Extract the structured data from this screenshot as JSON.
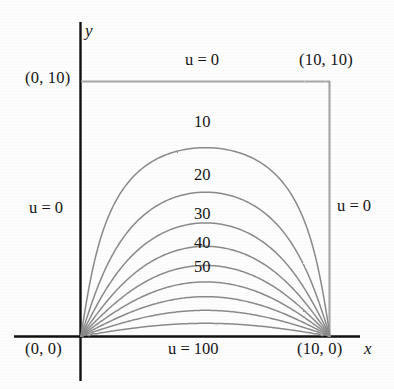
{
  "figure": {
    "axes": {
      "x_label": "x",
      "y_label": "y"
    },
    "corner_labels": [
      {
        "name": "origin",
        "text": "(0, 0)"
      },
      {
        "name": "top-left",
        "text": "(0, 10)"
      },
      {
        "name": "top-right",
        "text": "(10, 10)"
      },
      {
        "name": "bottom-right",
        "text": "(10, 0)"
      }
    ],
    "boundary_conditions": [
      {
        "name": "top",
        "text": "u = 0"
      },
      {
        "name": "left",
        "text": "u = 0"
      },
      {
        "name": "right",
        "text": "u = 0"
      },
      {
        "name": "bottom",
        "text": "u = 100"
      }
    ],
    "contour_labels": [
      "10",
      "20",
      "30",
      "40",
      "50"
    ]
  },
  "chart_data": {
    "type": "line",
    "xlabel": "x",
    "ylabel": "y",
    "xlim": [
      0,
      10
    ],
    "ylim": [
      0,
      10
    ],
    "grid": false,
    "legend": "none",
    "domain": {
      "x_min": 0,
      "x_max": 10,
      "y_min": 0,
      "y_max": 10
    },
    "boundary_values": {
      "top": 0,
      "left": 0,
      "right": 0,
      "bottom": 100
    },
    "labeled_levels": [
      10,
      20,
      30,
      40,
      50
    ],
    "unlabeled_levels": [
      60,
      70,
      80,
      90
    ],
    "series": [
      {
        "name": "u = 10",
        "level": 10,
        "label": "10",
        "apex_y": 7.05,
        "labeled": true
      },
      {
        "name": "u = 20",
        "level": 20,
        "label": "20",
        "apex_y": 5.05,
        "labeled": true
      },
      {
        "name": "u = 30",
        "level": 30,
        "label": "30",
        "apex_y": 3.85,
        "labeled": true
      },
      {
        "name": "u = 40",
        "level": 40,
        "label": "40",
        "apex_y": 2.85,
        "labeled": true
      },
      {
        "name": "u = 50",
        "level": 50,
        "label": "50",
        "apex_y": 2.05,
        "labeled": true
      },
      {
        "name": "u = 60",
        "level": 60,
        "label": "",
        "apex_y": 1.55,
        "labeled": false
      },
      {
        "name": "u = 70",
        "level": 70,
        "label": "",
        "apex_y": 1.15,
        "labeled": false
      },
      {
        "name": "u = 80",
        "level": 80,
        "label": "",
        "apex_y": 0.78,
        "labeled": false
      },
      {
        "name": "u = 90",
        "level": 90,
        "label": "",
        "apex_y": 0.42,
        "labeled": false
      }
    ],
    "annotations": [
      {
        "text": "u = 0",
        "x": 5,
        "y": 10.6
      },
      {
        "text": "u = 0",
        "x": -1.4,
        "y": 5.0
      },
      {
        "text": "u = 0",
        "x": 11.5,
        "y": 5.1
      },
      {
        "text": "u = 100",
        "x": 5,
        "y": -0.6
      },
      {
        "text": "(0, 0)",
        "x": -1.1,
        "y": -0.6
      },
      {
        "text": "(0, 10)",
        "x": -1.3,
        "y": 10.0
      },
      {
        "text": "(10, 10)",
        "x": 11.3,
        "y": 10.6
      },
      {
        "text": "(10, 0)",
        "x": 11.0,
        "y": -0.6
      }
    ]
  },
  "colors": {
    "axis": "#111111",
    "contour": "#8a8a8a",
    "boundary": "#a0a0a0",
    "text": "#141414",
    "background": "#fdfdfd"
  }
}
